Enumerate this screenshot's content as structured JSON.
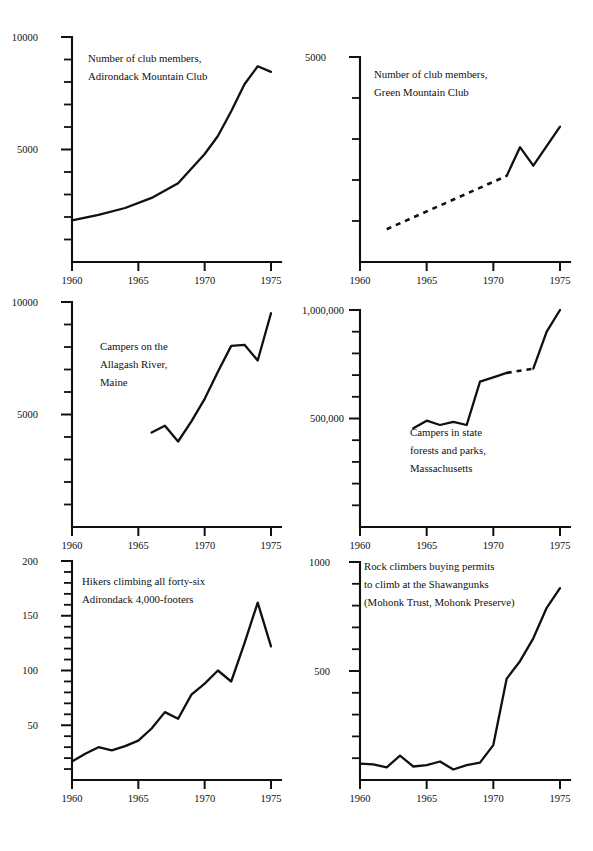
{
  "figure": {
    "layout": "2 columns x 3 rows of line charts",
    "panel_count": 6
  },
  "chart_data": [
    {
      "id": "adirondack-mountain-club",
      "type": "line",
      "title": "Number of club members, Adirondack Mountain Club",
      "title_lines": [
        "Number of club members,",
        "Adirondack Mountain Club"
      ],
      "xlabel": "",
      "ylabel": "",
      "xlim": [
        1960,
        1975
      ],
      "ylim": [
        0,
        10000
      ],
      "ytick_labels": [
        "10000",
        "5000"
      ],
      "ytick_values": [
        10000,
        5000
      ],
      "ytick_step_minor": 1000,
      "xtick_labels": [
        "1960",
        "1965",
        "1970",
        "1975"
      ],
      "xtick_values": [
        1960,
        1965,
        1970,
        1975
      ],
      "grid": false,
      "legend": "none",
      "x": [
        1960,
        1962,
        1964,
        1966,
        1968,
        1970,
        1971,
        1972,
        1973,
        1974,
        1975
      ],
      "values": [
        1850,
        2100,
        2400,
        2850,
        3500,
        4800,
        5600,
        6700,
        7900,
        8700,
        8450
      ],
      "dashed_segment": null
    },
    {
      "id": "green-mountain-club",
      "type": "line",
      "title": "Number of club members, Green Mountain Club",
      "title_lines": [
        "Number of club members,",
        "Green Mountain Club"
      ],
      "xlabel": "",
      "ylabel": "",
      "xlim": [
        1960,
        1975
      ],
      "ylim": [
        0,
        5000
      ],
      "ytick_labels": [
        "5000"
      ],
      "ytick_values": [
        5000
      ],
      "ytick_step_minor": 1000,
      "xtick_labels": [
        "1960",
        "1965",
        "1970",
        "1975"
      ],
      "xtick_values": [
        1960,
        1965,
        1970,
        1975
      ],
      "grid": false,
      "legend": "none",
      "x": [
        1962,
        1971,
        1972,
        1973,
        1975
      ],
      "values": [
        800,
        2100,
        2800,
        2350,
        3300
      ],
      "dashed_segment": {
        "from_year": 1962,
        "to_year": 1971,
        "note": "dashed (interpolated) portion 1962-1971, solid thereafter"
      }
    },
    {
      "id": "allagash-river-campers",
      "type": "line",
      "title": "Campers on the Allagash River, Maine",
      "title_lines": [
        "Campers on the",
        "Allagash River,",
        "Maine"
      ],
      "xlabel": "",
      "ylabel": "",
      "xlim": [
        1960,
        1975
      ],
      "ylim": [
        0,
        10000
      ],
      "ytick_labels": [
        "10000",
        "5000"
      ],
      "ytick_values": [
        10000,
        5000
      ],
      "ytick_step_minor": 1000,
      "xtick_labels": [
        "1960",
        "1965",
        "1970",
        "1975"
      ],
      "xtick_values": [
        1960,
        1965,
        1970,
        1975
      ],
      "grid": false,
      "legend": "none",
      "x": [
        1966,
        1967,
        1968,
        1969,
        1970,
        1971,
        1972,
        1973,
        1974,
        1975
      ],
      "values": [
        4200,
        4500,
        3800,
        4700,
        5700,
        6900,
        8050,
        8100,
        7400,
        9500
      ],
      "dashed_segment": null
    },
    {
      "id": "massachusetts-state-campers",
      "type": "line",
      "title": "Campers in state forests and parks, Massachusetts",
      "title_lines": [
        "Campers in state",
        "forests and parks,",
        "Massachusetts"
      ],
      "xlabel": "",
      "ylabel": "",
      "xlim": [
        1960,
        1975
      ],
      "ylim": [
        0,
        1000000
      ],
      "ytick_labels": [
        "1,000,000",
        "500,000"
      ],
      "ytick_values": [
        1000000,
        500000
      ],
      "ytick_step_minor": 100000,
      "xtick_labels": [
        "1960",
        "1965",
        "1970",
        "1975"
      ],
      "xtick_values": [
        1960,
        1965,
        1970,
        1975
      ],
      "grid": false,
      "legend": "none",
      "x": [
        1964,
        1965,
        1966,
        1967,
        1968,
        1969,
        1970,
        1971,
        1973,
        1974,
        1975
      ],
      "values": [
        455000,
        490000,
        470000,
        485000,
        470000,
        670000,
        690000,
        710000,
        730000,
        900000,
        1000000
      ],
      "dashed_segment": {
        "from_year": 1971,
        "to_year": 1973,
        "note": "dashed (estimated) portion between 1971 and 1973"
      }
    },
    {
      "id": "adirondack-46ers",
      "type": "line",
      "title": "Hikers climbing all forty-six Adirondack 4,000-footers",
      "title_lines": [
        "Hikers climbing all forty-six",
        "Adirondack 4,000-footers"
      ],
      "xlabel": "",
      "ylabel": "",
      "xlim": [
        1960,
        1975
      ],
      "ylim": [
        0,
        200
      ],
      "ytick_labels": [
        "200",
        "150",
        "100",
        "50"
      ],
      "ytick_values": [
        200,
        150,
        100,
        50
      ],
      "ytick_step_minor": 10,
      "xtick_labels": [
        "1960",
        "1965",
        "1970",
        "1975"
      ],
      "xtick_values": [
        1960,
        1965,
        1970,
        1975
      ],
      "grid": false,
      "legend": "none",
      "x": [
        1960,
        1961,
        1962,
        1963,
        1964,
        1965,
        1966,
        1967,
        1968,
        1969,
        1970,
        1971,
        1972,
        1973,
        1974,
        1975
      ],
      "values": [
        17,
        24,
        30,
        27,
        31,
        36,
        47,
        62,
        56,
        78,
        88,
        100,
        90,
        125,
        162,
        122
      ],
      "dashed_segment": null
    },
    {
      "id": "shawangunks-climbing-permits",
      "type": "line",
      "title": "Rock climbers buying permits to climb at the Shawangunks (Mohonk Trust, Mohonk Preserve)",
      "title_lines": [
        "Rock climbers buying permits",
        "to climb at the Shawangunks",
        "(Mohonk Trust, Mohonk Preserve)"
      ],
      "xlabel": "",
      "ylabel": "",
      "xlim": [
        1960,
        1975
      ],
      "ylim": [
        0,
        1000
      ],
      "ytick_labels": [
        "1000",
        "500"
      ],
      "ytick_values": [
        1000,
        500
      ],
      "ytick_step_minor": 100,
      "xtick_labels": [
        "1960",
        "1965",
        "1970",
        "1975"
      ],
      "xtick_values": [
        1960,
        1965,
        1970,
        1975
      ],
      "grid": false,
      "legend": "none",
      "x": [
        1960,
        1961,
        1962,
        1963,
        1964,
        1965,
        1966,
        1967,
        1968,
        1969,
        1970,
        1971,
        1972,
        1973,
        1974,
        1975
      ],
      "values": [
        75,
        72,
        58,
        112,
        62,
        68,
        85,
        48,
        68,
        80,
        160,
        465,
        545,
        650,
        790,
        880
      ],
      "dashed_segment": null
    }
  ]
}
